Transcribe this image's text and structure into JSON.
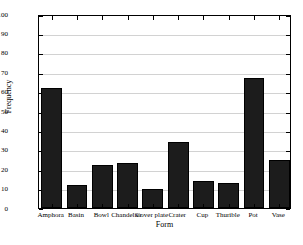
{
  "chart_data": {
    "type": "bar",
    "title": "",
    "xlabel": "Form",
    "ylabel": "Frequency",
    "categories": [
      "Amphora",
      "Basin",
      "Bowl",
      "Chandelier",
      "Cover plate",
      "Crater",
      "Cup",
      "Thurible",
      "Pot",
      "Vase"
    ],
    "values": [
      62,
      12,
      22,
      23,
      10,
      34,
      14,
      13,
      67,
      25
    ],
    "ylim": [
      0,
      100
    ],
    "ytick_labels": [
      "0",
      "10",
      "20",
      "30",
      "40",
      "50",
      "60",
      "70",
      "80",
      "90",
      "100"
    ],
    "yticks": [
      0,
      10,
      20,
      30,
      40,
      50,
      60,
      70,
      80,
      90,
      100
    ],
    "grid": true,
    "legend": "none",
    "bar_color": "#1c1c1c",
    "grid_color": "#d2d2d2",
    "axis_color": "#000000",
    "background_color": "#ffffff"
  }
}
